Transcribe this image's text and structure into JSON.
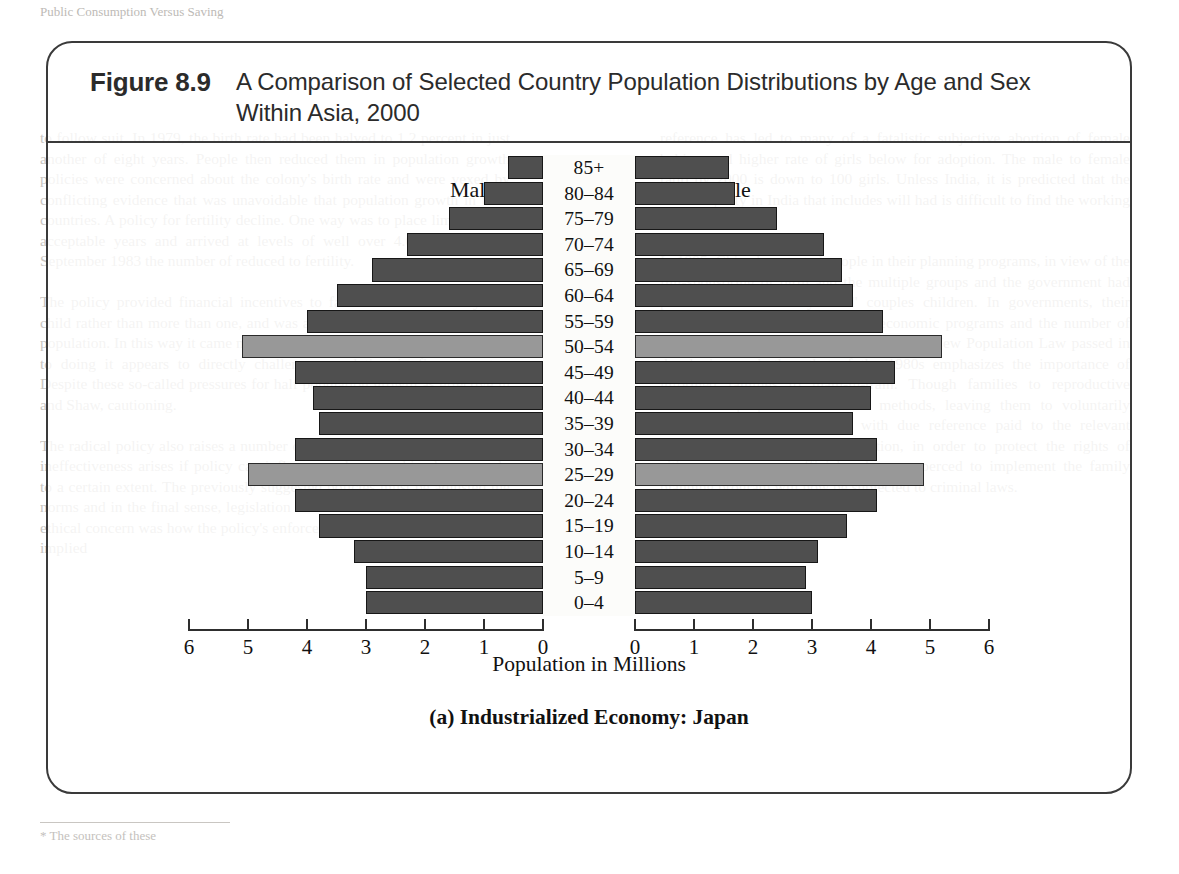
{
  "figure": {
    "label": "Figure 8.9",
    "title": "A Comparison of Selected Country Population Distributions by Age and Sex Within Asia, 2000",
    "caption": "(a) Industrialized Economy: Japan",
    "male_label": "Male",
    "female_label": "Female"
  },
  "colors": {
    "bar": "#4f4f4f",
    "bar_highlight": "#989898",
    "bar_outline": "#171717",
    "frame": "#3a3a3a"
  },
  "chart_data": {
    "type": "bar",
    "subtype": "population-pyramid",
    "title": "A Comparison of Selected Country Population Distributions by Age and Sex Within Asia, 2000",
    "subtitle": "(a) Industrialized Economy: Japan",
    "xlabel": "Population in Millions",
    "ylabel": "",
    "categories": [
      "85+",
      "80–84",
      "75–79",
      "70–74",
      "65–69",
      "60–64",
      "55–59",
      "50–54",
      "45–49",
      "40–44",
      "35–39",
      "30–34",
      "25–29",
      "20–24",
      "15–19",
      "10–14",
      "5–9",
      "0–4"
    ],
    "series": [
      {
        "name": "Male",
        "values": [
          0.6,
          1.0,
          1.6,
          2.3,
          2.9,
          3.5,
          4.0,
          5.1,
          4.2,
          3.9,
          3.8,
          4.2,
          5.0,
          4.2,
          3.8,
          3.2,
          3.0,
          3.0
        ]
      },
      {
        "name": "Female",
        "values": [
          1.6,
          1.7,
          2.4,
          3.2,
          3.5,
          3.7,
          4.2,
          5.2,
          4.4,
          4.0,
          3.7,
          4.1,
          4.9,
          4.1,
          3.6,
          3.1,
          2.9,
          3.0
        ]
      }
    ],
    "highlighted_categories": [
      "50–54",
      "25–29"
    ],
    "xlim": [
      0,
      6
    ],
    "xticks": [
      0,
      1,
      2,
      3,
      4,
      5,
      6
    ],
    "xtick_labels_left": [
      "6",
      "5",
      "4",
      "3",
      "2",
      "1",
      "0"
    ],
    "xtick_labels_right": [
      "0",
      "1",
      "2",
      "3",
      "4",
      "5",
      "6"
    ],
    "grid": false,
    "legend": "inline-axis-labels"
  },
  "page_bleed": {
    "header": "Public Consumption Versus Saving",
    "left_column": "to follow suit. In 1979, the birth rate had been halved to 1.2 percent in just another of eight years. People then reduced them in population growth policies were concerned about the colony's birth rate and were vexed by conflicting evidence that was unavoidable that population growth in their countries. A policy for fertility decline. One way was to place limits on the acceptable years and arrived at levels of well over 4.0 a decade. By September 1983 the number of reduced to fertility.\n\nThe policy provided financial incentives to families who held only one child rather than more than one, and was an effective reduction of a raised population. In this way it came more for the government policies to commit to doing it appears to directly challenge population in figures, notes. Despite these so-called pressures for half population growth as effective in and Shaw, cautioning.\n\nThe radical policy also raises a number of ethical questions. Firstly, policy ineffectiveness arises if policy can influence a demographic changes only to a certain extent. The previously suggested policies must be adjusted the norms and in the final sense, legislation had been met with resistance. The ethical concern was how the policy's enforcement, for house, this culturally implied",
    "right_column": "reference has led to many of a fatalistic subjective abortion of female babies, and higher rate of girls below for adoption. The male to female ratio by 2000 is down to 100 girls. Unless India, it is predicted that the male majority in India that includes will had is difficult to find the working or by of women.\n\nIn 1995, China has started people in their planning programs, in view of the full-sponsoring of birth and the multiple groups and the government had put into 'the One-Only child' couples children. In governments, their acceptable number of children in economic programs and the number of children in the figure is even lower in the New Population Law passed in developing each than that of the 1980s emphasizes the importance of informed families to main-in-train. Though families to reproductive choices at proper consideration methods, leaving them to voluntarily decide upon family size but with due reference paid to the relevant population. Furthermore, in addition, in order to protect the rights of citizens government officials who are coerced to implement the family planning program will now be subjected to criminal laws.",
    "footnote": "* The sources of these"
  }
}
